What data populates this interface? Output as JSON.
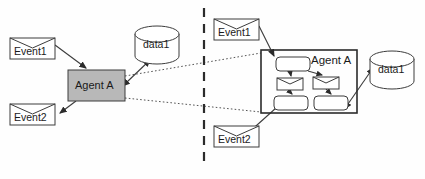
{
  "diagram": {
    "divider": {
      "name": "vertical-dashed-divider",
      "x": 204,
      "y1": 8,
      "y2": 166,
      "style": "dashed",
      "color": "#2b2b2b"
    },
    "colors": {
      "agent_box_fill": "#b8b8b8",
      "shape_fill": "#ffffff",
      "stroke": "#3c3c3c",
      "background": "#fefefe",
      "dotted_link": "#555555"
    },
    "left_panel": {
      "name": "abstract-view",
      "nodes": [
        {
          "id": "left-event1",
          "type": "event",
          "label": "Event1",
          "x": 10,
          "y": 38,
          "w": 45,
          "h": 21
        },
        {
          "id": "left-event2",
          "type": "event",
          "label": "Event2",
          "x": 10,
          "y": 104,
          "w": 45,
          "h": 21
        },
        {
          "id": "left-agent-a",
          "type": "agent-box",
          "label": "Agent A",
          "x": 68,
          "y": 70,
          "w": 57,
          "h": 31,
          "fill": "#b8b8b8"
        },
        {
          "id": "left-data1",
          "type": "datastore",
          "label": "data1",
          "cx": 157,
          "cy": 45,
          "rx": 22,
          "ry": 14
        }
      ],
      "edges": [
        {
          "id": "left-edge-event1-agent",
          "from": "left-event1",
          "to": "left-agent-a",
          "style": "solid",
          "arrow": "end"
        },
        {
          "id": "left-edge-agent-event2",
          "from": "left-agent-a",
          "to": "left-event2",
          "style": "solid",
          "arrow": "end"
        },
        {
          "id": "left-edge-agent-data1",
          "from": "left-agent-a",
          "to": "left-data1",
          "style": "solid",
          "arrow": "both"
        }
      ]
    },
    "right_panel": {
      "name": "refined-view",
      "nodes": [
        {
          "id": "right-event1",
          "type": "event",
          "label": "Event1",
          "x": 214,
          "y": 19,
          "w": 45,
          "h": 21
        },
        {
          "id": "right-event2",
          "type": "event",
          "label": "Event2",
          "x": 214,
          "y": 126,
          "w": 45,
          "h": 21
        },
        {
          "id": "right-agent-a",
          "type": "agent-container",
          "label": "Agent A",
          "x": 261,
          "y": 50,
          "w": 96,
          "h": 63
        },
        {
          "id": "right-data1",
          "type": "datastore",
          "label": "data1",
          "cx": 392,
          "cy": 70,
          "rx": 22,
          "ry": 14
        }
      ],
      "inner_nodes": [
        {
          "id": "inner-task-top",
          "type": "task",
          "x": 276,
          "y": 57,
          "w": 34,
          "h": 14
        },
        {
          "id": "inner-event-left",
          "type": "event",
          "x": 277,
          "y": 78,
          "w": 26,
          "h": 12
        },
        {
          "id": "inner-event-right",
          "type": "event",
          "x": 313,
          "y": 77,
          "w": 26,
          "h": 12
        },
        {
          "id": "inner-task-bottom-left",
          "type": "task",
          "x": 274,
          "y": 96,
          "w": 34,
          "h": 14
        },
        {
          "id": "inner-task-bottom-right",
          "type": "task",
          "x": 314,
          "y": 96,
          "w": 34,
          "h": 14
        }
      ],
      "inner_edges": [
        {
          "id": "inner-edge-top-to-event-left",
          "from": "inner-task-top",
          "to": "inner-event-left"
        },
        {
          "id": "inner-edge-top-to-event-right",
          "from": "inner-task-top",
          "to": "inner-event-right"
        },
        {
          "id": "inner-edge-event-left-to-task",
          "from": "inner-event-left",
          "to": "inner-task-bottom-left"
        },
        {
          "id": "inner-edge-event-right-to-task",
          "from": "inner-event-right",
          "to": "inner-task-bottom-right"
        }
      ],
      "edges": [
        {
          "id": "right-edge-event1-agent",
          "from": "right-event1",
          "to": "inner-task-top",
          "style": "solid",
          "arrow": "end"
        },
        {
          "id": "right-edge-agent-event2",
          "from": "inner-task-bottom-left",
          "to": "right-event2",
          "style": "solid",
          "arrow": "end"
        },
        {
          "id": "right-edge-agent-data1",
          "from": "inner-task-bottom-right",
          "to": "right-data1",
          "style": "solid",
          "arrow": "both"
        }
      ]
    },
    "cross_links": [
      {
        "id": "cross-link-upper",
        "name": "refinement-link-upper",
        "from": "left-agent-a",
        "to": "right-agent-a",
        "style": "dotted"
      },
      {
        "id": "cross-link-lower",
        "name": "refinement-link-lower",
        "from": "left-agent-a",
        "to": "right-agent-a",
        "style": "dotted"
      }
    ],
    "labels": {
      "left_event1": "Event1",
      "left_event2": "Event2",
      "left_agent": "Agent A",
      "left_data": "data1",
      "right_event1": "Event1",
      "right_event2": "Event2",
      "right_agent": "Agent A",
      "right_data": "data1"
    }
  }
}
